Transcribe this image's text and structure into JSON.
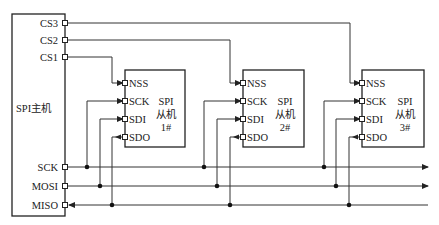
{
  "master": {
    "label": "SPI主机",
    "pins": {
      "cs3": "CS3",
      "cs2": "CS2",
      "cs1": "CS1",
      "sck": "SCK",
      "mosi": "MOSI",
      "miso": "MISO"
    }
  },
  "slaves": [
    {
      "line1": "SPI",
      "line2": "从机",
      "line3": "1#",
      "pins": {
        "nss": "NSS",
        "sck": "SCK",
        "sdi": "SDI",
        "sdo": "SDO"
      }
    },
    {
      "line1": "SPI",
      "line2": "从机",
      "line3": "2#",
      "pins": {
        "nss": "NSS",
        "sck": "SCK",
        "sdi": "SDI",
        "sdo": "SDO"
      }
    },
    {
      "line1": "SPI",
      "line2": "从机",
      "line3": "3#",
      "pins": {
        "nss": "NSS",
        "sck": "SCK",
        "sdi": "SDI",
        "sdo": "SDO"
      }
    }
  ]
}
